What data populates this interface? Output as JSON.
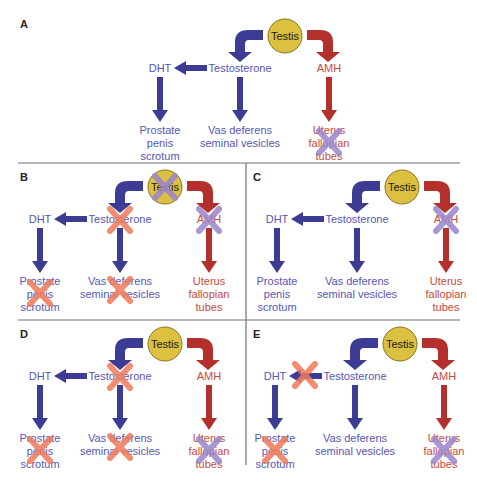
{
  "colors": {
    "male_arrow": "#3c3c94",
    "male_text": "#5656b4",
    "female_arrow": "#b4302c",
    "female_text": "#c84a3c",
    "testis_fill": "#dcc040",
    "testis_stroke": "#8a7420",
    "x_orange": "#f07a5a",
    "x_purple": "#9a86cc",
    "frame": "#707070"
  },
  "nodes": {
    "testis": "Testis",
    "testosterone": "Testosterone",
    "dht": "DHT",
    "amh": "AMH",
    "prostate": [
      "Prostate",
      "penis",
      "scrotum"
    ],
    "vas": [
      "Vas deferens",
      "seminal vesicles"
    ],
    "uterus": [
      "Uterus",
      "fallopian",
      "tubes"
    ]
  },
  "panels": [
    {
      "id": "A",
      "label": "A",
      "label_pos": [
        20,
        28
      ],
      "origin": [
        285,
        36
      ],
      "crosses": [
        {
          "target": "uterus",
          "color": "purple"
        }
      ]
    },
    {
      "id": "B",
      "label": "B",
      "label_pos": [
        20,
        181
      ],
      "origin": [
        165,
        187
      ],
      "crosses": [
        {
          "target": "testis",
          "color": "purple"
        },
        {
          "target": "testosterone",
          "color": "orange"
        },
        {
          "target": "amh",
          "color": "purple"
        },
        {
          "target": "prostate",
          "color": "orange"
        },
        {
          "target": "vas",
          "color": "orange"
        }
      ]
    },
    {
      "id": "C",
      "label": "C",
      "label_pos": [
        253,
        181
      ],
      "origin": [
        402,
        187
      ],
      "crosses": [
        {
          "target": "amh",
          "color": "purple"
        }
      ]
    },
    {
      "id": "D",
      "label": "D",
      "label_pos": [
        20,
        338
      ],
      "origin": [
        165,
        344
      ],
      "crosses": [
        {
          "target": "testosterone",
          "color": "orange"
        },
        {
          "target": "prostate",
          "color": "orange"
        },
        {
          "target": "vas",
          "color": "orange"
        },
        {
          "target": "uterus",
          "color": "purple"
        }
      ]
    },
    {
      "id": "E",
      "label": "E",
      "label_pos": [
        253,
        338
      ],
      "origin": [
        400,
        344
      ],
      "crosses": [
        {
          "target": "dht_arrow",
          "color": "orange"
        },
        {
          "target": "prostate",
          "color": "orange"
        },
        {
          "target": "uterus",
          "color": "purple"
        }
      ]
    }
  ],
  "frame": {
    "h_lines": [
      [
        18,
        163,
        460,
        163
      ],
      [
        18,
        320,
        460,
        320
      ]
    ],
    "v_lines": [
      [
        246,
        163,
        246,
        465
      ]
    ]
  }
}
